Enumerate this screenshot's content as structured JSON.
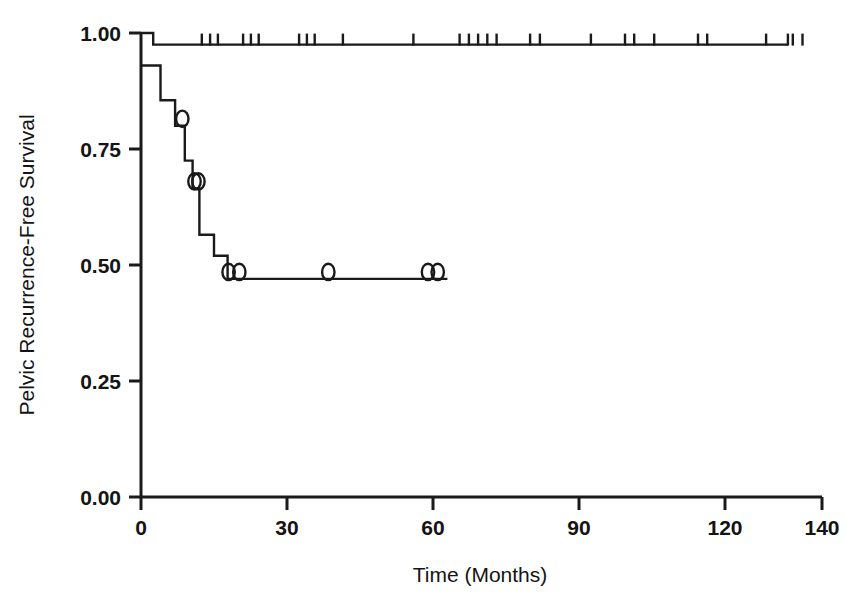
{
  "chart_data": {
    "type": "line",
    "title": "",
    "subtitle": "",
    "xlabel": "Time (Months)",
    "ylabel": "Pelvic Recurrence-Free Survival",
    "xlim": [
      0,
      140
    ],
    "ylim": [
      0.0,
      1.0
    ],
    "xticks": [
      0,
      30,
      60,
      90,
      120,
      140
    ],
    "xticklabels": [
      "0",
      "30",
      "60",
      "90",
      "120",
      "140"
    ],
    "yticks": [
      0.0,
      0.25,
      0.5,
      0.75,
      1.0
    ],
    "yticklabels": [
      "0.00",
      "0.25",
      "0.50",
      "0.75",
      "1.00"
    ],
    "grid": false,
    "legend": null,
    "line_color": "#1a1a1a",
    "series": [
      {
        "name": "Upper curve",
        "type": "kaplan-meier-step",
        "censor_marker": "tick",
        "steps": [
          {
            "t": 0,
            "s": 1.0
          },
          {
            "t": 2.5,
            "s": 1.0
          },
          {
            "t": 2.5,
            "s": 0.975
          },
          {
            "t": 133,
            "s": 0.975
          }
        ],
        "censor_times": [
          12.5,
          14.2,
          15.8,
          21.0,
          22.6,
          24.2,
          32.5,
          34.1,
          35.7,
          41.5,
          56.0,
          65.5,
          67.4,
          69.3,
          71.2,
          73.1,
          80.0,
          82.0,
          92.5,
          99.5,
          101.4,
          114.5,
          116.4,
          134.0,
          136.0,
          105.5,
          128.5,
          133.0
        ]
      },
      {
        "name": "Lower curve",
        "type": "kaplan-meier-step",
        "censor_marker": "circle",
        "steps": [
          {
            "t": 0,
            "s": 0.93
          },
          {
            "t": 4.0,
            "s": 0.93
          },
          {
            "t": 4.0,
            "s": 0.855
          },
          {
            "t": 7.0,
            "s": 0.855
          },
          {
            "t": 7.0,
            "s": 0.8
          },
          {
            "t": 9.0,
            "s": 0.8
          },
          {
            "t": 9.0,
            "s": 0.725
          },
          {
            "t": 10.6,
            "s": 0.725
          },
          {
            "t": 10.6,
            "s": 0.665
          },
          {
            "t": 12.0,
            "s": 0.665
          },
          {
            "t": 12.0,
            "s": 0.565
          },
          {
            "t": 15.0,
            "s": 0.565
          },
          {
            "t": 15.0,
            "s": 0.52
          },
          {
            "t": 17.8,
            "s": 0.52
          },
          {
            "t": 17.8,
            "s": 0.47
          },
          {
            "t": 63.0,
            "s": 0.47
          }
        ],
        "censor_times": [
          8.5,
          11.0,
          11.8,
          18.0,
          20.2,
          38.5,
          59.0,
          61.0
        ],
        "censor_values": [
          0.8,
          0.665,
          0.665,
          0.47,
          0.47,
          0.47,
          0.47,
          0.47
        ]
      }
    ]
  },
  "axes": {
    "y_label": "Pelvic Recurrence-Free Survival",
    "x_label": "Time (Months)",
    "y_tick_0": "0.00",
    "y_tick_1": "0.25",
    "y_tick_2": "0.50",
    "y_tick_3": "0.75",
    "y_tick_4": "1.00",
    "x_tick_0": "0",
    "x_tick_1": "30",
    "x_tick_2": "60",
    "x_tick_3": "90",
    "x_tick_4": "120",
    "x_tick_5": "140"
  }
}
